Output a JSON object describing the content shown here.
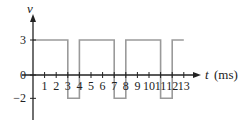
{
  "chart_data": {
    "type": "line",
    "subtype": "step",
    "title": "",
    "xlabel": "t (ms)",
    "xlabel_var": "t",
    "xlabel_unit": "(ms)",
    "ylabel": "v",
    "x_ticks": [
      1,
      2,
      3,
      4,
      5,
      6,
      7,
      8,
      9,
      10,
      11,
      12,
      13
    ],
    "x_tick_labels": [
      "1",
      "2",
      "3",
      "4",
      "5",
      "6",
      "7",
      "8",
      "9",
      "10",
      "11",
      "12",
      "13"
    ],
    "y_ticks": [
      3,
      0,
      -2
    ],
    "y_tick_labels": [
      "3",
      "0",
      "−2"
    ],
    "xlim": [
      0,
      13
    ],
    "ylim": [
      -2,
      3
    ],
    "grid": false,
    "legend": null,
    "series": [
      {
        "name": "v(t)",
        "color": "#9a9a9a",
        "points": [
          [
            0,
            3
          ],
          [
            3,
            3
          ],
          [
            3,
            -2
          ],
          [
            4,
            -2
          ],
          [
            4,
            3
          ],
          [
            7,
            3
          ],
          [
            7,
            -2
          ],
          [
            8,
            -2
          ],
          [
            8,
            3
          ],
          [
            11,
            3
          ],
          [
            11,
            -2
          ],
          [
            12,
            -2
          ],
          [
            12,
            3
          ],
          [
            13,
            3
          ]
        ]
      }
    ]
  },
  "colors": {
    "axis": "#222222",
    "waveform": "#9a9a9a",
    "background": "#ffffff"
  }
}
